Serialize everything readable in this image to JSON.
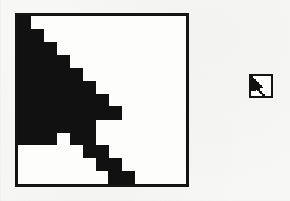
{
  "figure": {
    "kind": "cursor-pixel-magnification-figure",
    "background_color": "#f7f7f5",
    "ink_color": "#111111",
    "panels": [
      {
        "id": "magnified",
        "name": "magnified-cursor-panel",
        "label": "",
        "border_color": "#141414",
        "border_width_px": 3,
        "fill_color": "#fdfdfb",
        "x": 15,
        "y": 13,
        "width": 174,
        "height": 174,
        "grid_columns": 13,
        "grid_rows": 13,
        "cell_px": 13,
        "description": "Mouse arrow cursor drawn at pixel-block magnification"
      },
      {
        "id": "actual",
        "name": "actual-size-cursor-panel",
        "label": "",
        "border_color": "#141414",
        "border_width_px": 2,
        "fill_color": "#fdfdfb",
        "x": 249,
        "y": 74,
        "width": 24,
        "height": 24,
        "grid_columns": 13,
        "grid_rows": 13,
        "cell_px": 1.54,
        "description": "The same mouse arrow cursor drawn at actual screen size"
      }
    ]
  },
  "cursor_bitmap": {
    "name": "arrow-pointer-cursor",
    "columns": 13,
    "rows": 13,
    "on_value": 1,
    "off_value": 0,
    "rows_data": [
      [
        1,
        0,
        0,
        0,
        0,
        0,
        0,
        0,
        0,
        0,
        0,
        0,
        0
      ],
      [
        1,
        1,
        0,
        0,
        0,
        0,
        0,
        0,
        0,
        0,
        0,
        0,
        0
      ],
      [
        1,
        1,
        1,
        0,
        0,
        0,
        0,
        0,
        0,
        0,
        0,
        0,
        0
      ],
      [
        1,
        1,
        1,
        1,
        0,
        0,
        0,
        0,
        0,
        0,
        0,
        0,
        0
      ],
      [
        1,
        1,
        1,
        1,
        1,
        0,
        0,
        0,
        0,
        0,
        0,
        0,
        0
      ],
      [
        1,
        1,
        1,
        1,
        1,
        1,
        0,
        0,
        0,
        0,
        0,
        0,
        0
      ],
      [
        1,
        1,
        1,
        1,
        1,
        1,
        1,
        0,
        0,
        0,
        0,
        0,
        0
      ],
      [
        1,
        1,
        1,
        1,
        1,
        1,
        1,
        1,
        0,
        0,
        0,
        0,
        0
      ],
      [
        1,
        1,
        1,
        1,
        1,
        1,
        0,
        0,
        0,
        0,
        0,
        0,
        0
      ],
      [
        1,
        1,
        1,
        0,
        1,
        1,
        0,
        0,
        0,
        0,
        0,
        0,
        0
      ],
      [
        0,
        0,
        0,
        0,
        0,
        1,
        1,
        0,
        0,
        0,
        0,
        0,
        0
      ],
      [
        0,
        0,
        0,
        0,
        0,
        0,
        1,
        1,
        0,
        0,
        0,
        0,
        0
      ],
      [
        0,
        0,
        0,
        0,
        0,
        0,
        0,
        1,
        1,
        0,
        0,
        0,
        0
      ]
    ]
  }
}
